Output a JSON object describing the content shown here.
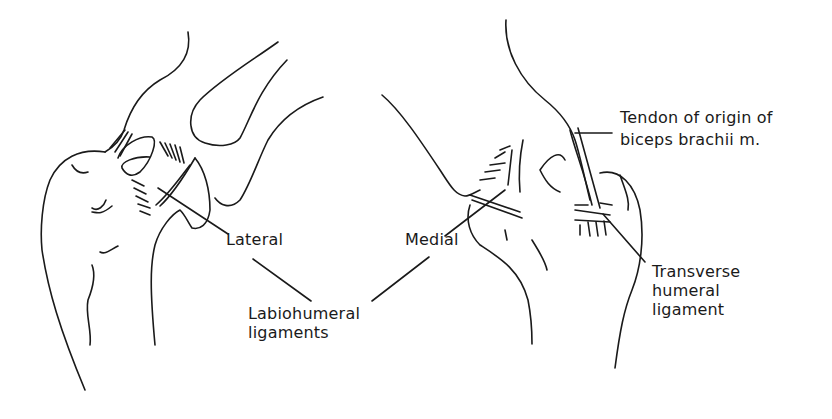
{
  "figure": {
    "type": "anatomical line drawing",
    "views": [
      {
        "name": "lateral-view",
        "position": "left"
      },
      {
        "name": "medial-view",
        "position": "right"
      }
    ],
    "ink_color": "#1a1a1a",
    "background_color": "#ffffff"
  },
  "labels": {
    "lateral": "Lateral",
    "medial": "Medial",
    "labiohumeral_line1": "Labiohumeral",
    "labiohumeral_line2": "ligaments",
    "tendon_line1": "Tendon of origin of",
    "tendon_line2": "biceps brachii m.",
    "transverse_line1": "Transverse",
    "transverse_line2": "humeral",
    "transverse_line3": "ligament"
  }
}
